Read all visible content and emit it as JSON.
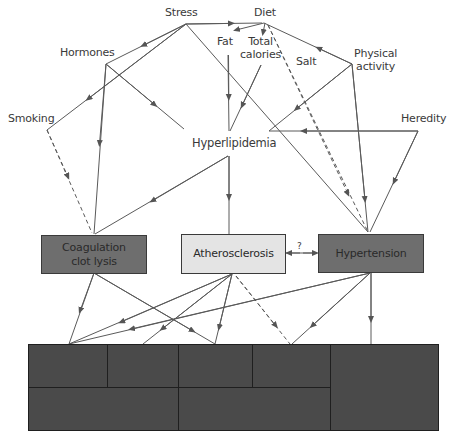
{
  "diagram": {
    "title": "",
    "risk_factors": [
      {
        "id": "stress",
        "label": "Stress"
      },
      {
        "id": "diet",
        "label": "Diet"
      },
      {
        "id": "hormones",
        "label": "Hormones"
      },
      {
        "id": "fat",
        "label": "Fat"
      },
      {
        "id": "total_calories",
        "label_line1": "Total",
        "label_line2": "calories"
      },
      {
        "id": "salt",
        "label": "Salt"
      },
      {
        "id": "physical_activity",
        "label_line1": "Physical",
        "label_line2": "activity"
      },
      {
        "id": "smoking",
        "label": "Smoking"
      },
      {
        "id": "heredity",
        "label": "Heredity"
      },
      {
        "id": "hyperlipidemia",
        "label": "Hyperlipidemia"
      }
    ],
    "conditions": [
      {
        "id": "coagulation",
        "label_line1": "Coagulation",
        "label_line2": "clot lysis",
        "fill": "#6e6e6e"
      },
      {
        "id": "atherosclerosis",
        "label": "Atherosclerosis",
        "fill": "#e4e4e4"
      },
      {
        "id": "hypertension",
        "label": "Hypertension",
        "fill": "#6e6e6e"
      }
    ],
    "uncertain_link_label": "?",
    "outcome_block": {
      "fill": "#4a4a4a",
      "cells": 7,
      "labels_visible": false
    },
    "colors": {
      "line": "#555555",
      "text": "#3a3a3a",
      "background": "#ffffff"
    }
  }
}
